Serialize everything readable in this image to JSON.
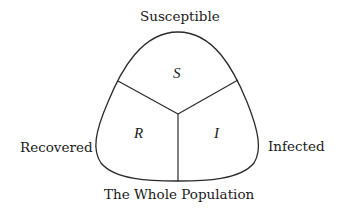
{
  "diagram": {
    "type": "compartment-diagram",
    "labels": {
      "top": "Susceptible",
      "left": "Recovered",
      "right": "Infected",
      "bottom": "The Whole Population"
    },
    "compartments": [
      {
        "id": "S",
        "symbol": "S",
        "name": "Susceptible"
      },
      {
        "id": "R",
        "symbol": "R",
        "name": "Recovered"
      },
      {
        "id": "I",
        "symbol": "I",
        "name": "Infected"
      }
    ],
    "colors": {
      "stroke": "#2a2a2a",
      "text": "#1a1a1a",
      "background": "#ffffff"
    }
  }
}
